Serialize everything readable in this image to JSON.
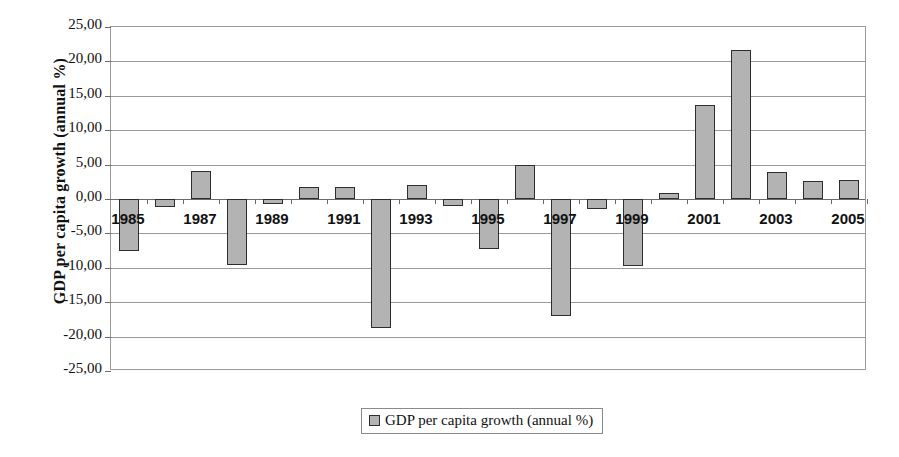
{
  "chart_data": {
    "type": "bar",
    "title": "",
    "xlabel": "",
    "ylabel": "GDP per capita growth (annual %)",
    "ylim": [
      -25,
      25
    ],
    "ytick_step": 5,
    "grid": true,
    "legend_position": "bottom",
    "legend_entries": [
      "GDP per capita growth (annual %)"
    ],
    "bar_color": "#b3b3b3",
    "bar_edge_color": "#2e2e2e",
    "decimal_separator": ",",
    "ytick_labels": [
      "25,00",
      "20,00",
      "15,00",
      "10,00",
      "5,00",
      "0,00",
      "-5,00",
      "-10,00",
      "-15,00",
      "-20,00",
      "-25,00"
    ],
    "ytick_values": [
      25,
      20,
      15,
      10,
      5,
      0,
      -5,
      -10,
      -15,
      -20,
      -25
    ],
    "categories": [
      "1985",
      "1986",
      "1987",
      "1988",
      "1989",
      "1990",
      "1991",
      "1992",
      "1993",
      "1994",
      "1995",
      "1996",
      "1997",
      "1998",
      "1999",
      "2000",
      "2001",
      "2002",
      "2003",
      "2004",
      "2005"
    ],
    "xtick_labels_shown": [
      "1985",
      "1987",
      "1989",
      "1991",
      "1993",
      "1995",
      "1997",
      "1999",
      "2001",
      "2003",
      "2005"
    ],
    "series": [
      {
        "name": "GDP per capita growth (annual %)",
        "values": [
          -7.6,
          -1.2,
          4.1,
          -9.6,
          -0.7,
          1.8,
          1.8,
          -18.7,
          2.1,
          -1.0,
          -7.3,
          4.9,
          -17.0,
          -1.4,
          -9.8,
          0.9,
          13.7,
          21.7,
          3.9,
          2.6,
          2.8
        ]
      }
    ]
  },
  "legend": {
    "label": "GDP per capita growth (annual %)"
  },
  "axis": {
    "y_title": "GDP per capita growth (annual %)"
  }
}
